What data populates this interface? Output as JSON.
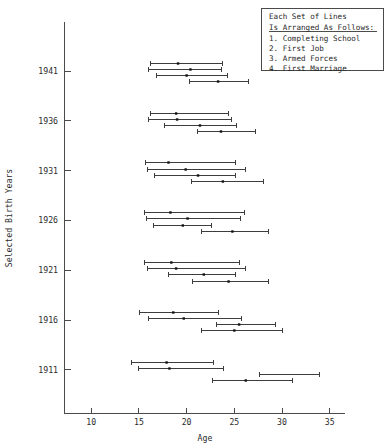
{
  "chart_data": {
    "type": "line",
    "title": "",
    "xlabel": "Age",
    "ylabel": "Selected Birth Years",
    "xlim": [
      7.2,
      36.6
    ],
    "ylim": [
      0,
      8
    ],
    "grid": false,
    "x_ticks": [
      10,
      15,
      20,
      25,
      30,
      35
    ],
    "x_tick_labels": [
      "10",
      "15",
      "20",
      "25",
      "30",
      "35"
    ],
    "y_ticks": [
      1941,
      1936,
      1931,
      1926,
      1921,
      1916,
      1911
    ],
    "y_tick_labels": [
      "1941",
      "1936",
      "1931",
      "1926",
      "1921",
      "1916",
      "1911"
    ],
    "event_order": [
      "Completing School",
      "First Job",
      "Armed Forces",
      "First Marriage"
    ],
    "marker": "median-dot-with-range-bar",
    "cohorts": [
      {
        "birth_year": 1941,
        "series": [
          {
            "name": "Completing School",
            "index": 1,
            "start": 16.2,
            "median": 19.1,
            "end": 23.7
          },
          {
            "name": "First Job",
            "index": 2,
            "start": 16.0,
            "median": 20.4,
            "end": 23.6
          },
          {
            "name": "Armed Forces",
            "index": 3,
            "start": 16.8,
            "median": 20.0,
            "end": 24.2
          },
          {
            "name": "First Marriage",
            "index": 4,
            "start": 20.3,
            "median": 23.3,
            "end": 26.4
          }
        ]
      },
      {
        "birth_year": 1936,
        "series": [
          {
            "name": "Completing School",
            "index": 1,
            "start": 16.2,
            "median": 18.9,
            "end": 24.3
          },
          {
            "name": "First Job",
            "index": 2,
            "start": 15.9,
            "median": 19.0,
            "end": 24.7
          },
          {
            "name": "Armed Forces",
            "index": 3,
            "start": 17.6,
            "median": 21.4,
            "end": 25.2
          },
          {
            "name": "First Marriage",
            "index": 4,
            "start": 21.1,
            "median": 23.6,
            "end": 27.2
          }
        ]
      },
      {
        "birth_year": 1931,
        "series": [
          {
            "name": "Completing School",
            "index": 1,
            "start": 15.6,
            "median": 18.1,
            "end": 25.1
          },
          {
            "name": "First Job",
            "index": 2,
            "start": 15.8,
            "median": 19.9,
            "end": 26.1
          },
          {
            "name": "Armed Forces",
            "index": 3,
            "start": 16.6,
            "median": 21.2,
            "end": 25.1
          },
          {
            "name": "First Marriage",
            "index": 4,
            "start": 20.5,
            "median": 23.8,
            "end": 28.0
          }
        ]
      },
      {
        "birth_year": 1926,
        "series": [
          {
            "name": "Completing School",
            "index": 1,
            "start": 15.5,
            "median": 18.3,
            "end": 26.0
          },
          {
            "name": "First Job",
            "index": 2,
            "start": 15.7,
            "median": 20.1,
            "end": 25.6
          },
          {
            "name": "Armed Forces",
            "index": 3,
            "start": 16.5,
            "median": 19.6,
            "end": 22.6
          },
          {
            "name": "First Marriage",
            "index": 4,
            "start": 21.5,
            "median": 24.8,
            "end": 28.5
          }
        ]
      },
      {
        "birth_year": 1921,
        "series": [
          {
            "name": "Completing School",
            "index": 1,
            "start": 15.5,
            "median": 18.4,
            "end": 25.5
          },
          {
            "name": "First Job",
            "index": 2,
            "start": 15.8,
            "median": 18.9,
            "end": 26.1
          },
          {
            "name": "Armed Forces",
            "index": 3,
            "start": 18.1,
            "median": 21.8,
            "end": 25.1
          },
          {
            "name": "First Marriage",
            "index": 4,
            "start": 20.6,
            "median": 24.4,
            "end": 28.5
          }
        ]
      },
      {
        "birth_year": 1916,
        "series": [
          {
            "name": "Completing School",
            "index": 1,
            "start": 15.0,
            "median": 18.6,
            "end": 23.3
          },
          {
            "name": "First Job",
            "index": 2,
            "start": 15.9,
            "median": 19.7,
            "end": 25.7
          },
          {
            "name": "Armed Forces",
            "index": 3,
            "start": 23.1,
            "median": 25.5,
            "end": 29.3
          },
          {
            "name": "First Marriage",
            "index": 4,
            "start": 21.5,
            "median": 25.0,
            "end": 30.0
          }
        ]
      },
      {
        "birth_year": 1911,
        "series": [
          {
            "name": "Completing School",
            "index": 1,
            "start": 14.2,
            "median": 17.9,
            "end": 22.8
          },
          {
            "name": "First Job",
            "index": 2,
            "start": 14.9,
            "median": 18.2,
            "end": 23.8
          },
          {
            "name": "Armed Forces",
            "index": 3,
            "start": 27.6,
            "median": null,
            "end": 33.9
          },
          {
            "name": "First Marriage",
            "index": 4,
            "start": 22.7,
            "median": 26.2,
            "end": 31.0
          }
        ]
      }
    ]
  },
  "legend": {
    "header_line1": "Each Set of Lines",
    "header_line2": "Is Arranged As Follows:",
    "items": [
      "1. Completing School",
      "2. First Job",
      "3. Armed Forces",
      "4. First Marriage"
    ]
  }
}
